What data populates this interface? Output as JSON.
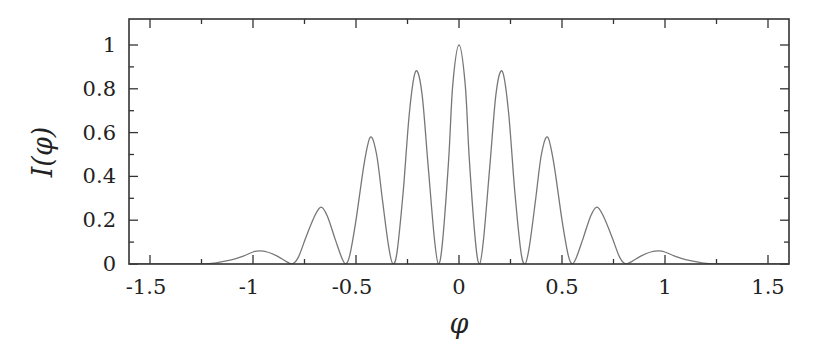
{
  "chart_data": {
    "type": "line",
    "title": "",
    "xlabel": "φ",
    "ylabel": "I(φ)",
    "xlim": [
      -1.6,
      1.6
    ],
    "ylim": [
      0,
      1.1
    ],
    "grid": false,
    "legend": null,
    "x_ticks": [
      -1.5,
      -1,
      -0.5,
      0,
      0.5,
      1,
      1.5
    ],
    "x_tick_labels": [
      "-1.5",
      "-1",
      "-0.5",
      "0",
      "0.5",
      "1",
      "1.5"
    ],
    "x_minor_ticks": [
      -1.25,
      -0.75,
      -0.25,
      0.25,
      0.75,
      1.25
    ],
    "y_ticks": [
      0,
      0.2,
      0.4,
      0.6,
      0.8,
      1
    ],
    "y_tick_labels": [
      "0",
      "0.2",
      "0.4",
      "0.6",
      "0.8",
      "1"
    ],
    "y_minor_ticks": [
      0.1,
      0.3,
      0.5,
      0.7,
      0.9
    ],
    "peaks": [
      {
        "x": -0.97,
        "y": 0.06
      },
      {
        "x": -0.67,
        "y": 0.26
      },
      {
        "x": -0.43,
        "y": 0.58
      },
      {
        "x": -0.21,
        "y": 0.88
      },
      {
        "x": 0.0,
        "y": 1.0
      },
      {
        "x": 0.21,
        "y": 0.88
      },
      {
        "x": 0.43,
        "y": 0.58
      },
      {
        "x": 0.67,
        "y": 0.26
      },
      {
        "x": 0.97,
        "y": 0.06
      }
    ],
    "minima_x": [
      -0.81,
      -0.55,
      -0.32,
      -0.1,
      0.1,
      0.32,
      0.55,
      0.81
    ],
    "series": [
      {
        "name": "I(φ)",
        "color": "#777777",
        "x": [
          -1.6,
          -1.3,
          -1.2,
          -1.1,
          -1.05,
          -1.0,
          -0.97,
          -0.93,
          -0.88,
          -0.84,
          -0.81,
          -0.78,
          -0.74,
          -0.7,
          -0.67,
          -0.64,
          -0.6,
          -0.57,
          -0.55,
          -0.53,
          -0.5,
          -0.46,
          -0.43,
          -0.4,
          -0.37,
          -0.34,
          -0.32,
          -0.3,
          -0.27,
          -0.24,
          -0.21,
          -0.18,
          -0.15,
          -0.12,
          -0.1,
          -0.08,
          -0.05,
          -0.03,
          0.0,
          0.03,
          0.05,
          0.08,
          0.1,
          0.12,
          0.15,
          0.18,
          0.21,
          0.24,
          0.27,
          0.3,
          0.32,
          0.34,
          0.37,
          0.4,
          0.43,
          0.46,
          0.5,
          0.53,
          0.55,
          0.57,
          0.6,
          0.64,
          0.67,
          0.7,
          0.74,
          0.78,
          0.81,
          0.84,
          0.88,
          0.93,
          0.97,
          1.0,
          1.05,
          1.1,
          1.2,
          1.3,
          1.6
        ],
        "y": [
          0.0,
          0.0,
          0.003,
          0.02,
          0.035,
          0.055,
          0.06,
          0.055,
          0.035,
          0.012,
          0.0,
          0.03,
          0.13,
          0.22,
          0.26,
          0.22,
          0.11,
          0.03,
          0.0,
          0.04,
          0.2,
          0.46,
          0.58,
          0.5,
          0.28,
          0.07,
          0.0,
          0.06,
          0.34,
          0.7,
          0.88,
          0.78,
          0.45,
          0.12,
          0.0,
          0.1,
          0.48,
          0.82,
          1.0,
          0.82,
          0.48,
          0.1,
          0.0,
          0.12,
          0.45,
          0.78,
          0.88,
          0.7,
          0.34,
          0.06,
          0.0,
          0.07,
          0.28,
          0.5,
          0.58,
          0.46,
          0.2,
          0.04,
          0.0,
          0.03,
          0.11,
          0.22,
          0.26,
          0.22,
          0.13,
          0.03,
          0.0,
          0.012,
          0.035,
          0.055,
          0.06,
          0.055,
          0.035,
          0.02,
          0.003,
          0.0,
          0.0
        ]
      }
    ]
  },
  "layout": {
    "plot_left_px": 129,
    "plot_right_px": 789,
    "plot_top_px": 19,
    "plot_bottom_px": 264,
    "x0_px": 459,
    "x_px_per_unit": 206,
    "y0_px": 264,
    "y_px_per_unit": 219,
    "frame_color": "#333333",
    "curve_color": "#777777"
  }
}
